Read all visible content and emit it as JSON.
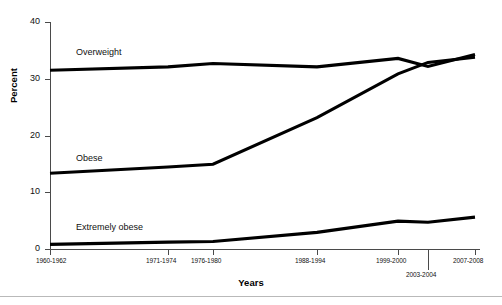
{
  "chart_data": {
    "type": "line",
    "title": "",
    "subtitle": "",
    "xlabel": "Years",
    "ylabel": "Percent",
    "categories": [
      "1960-1962",
      "1971-1974",
      "1976-1980",
      "1988-1994",
      "1999-2000",
      "2003-2004",
      "2007-2008"
    ],
    "ylim": [
      0,
      40
    ],
    "yticks": [
      0,
      10,
      20,
      30,
      40
    ],
    "ytick_labels": [
      "0",
      "10",
      "20",
      "30",
      "40"
    ],
    "grid": false,
    "legend_position": "inline-labels",
    "series": [
      {
        "name": "Overweight",
        "values": [
          31.5,
          32.1,
          32.7,
          32.1,
          33.6,
          32.2,
          34.3
        ],
        "color": "#000000"
      },
      {
        "name": "Obese",
        "values": [
          13.4,
          14.5,
          15.0,
          23.2,
          30.9,
          32.9,
          33.8
        ],
        "color": "#000000"
      },
      {
        "name": "Extremely obese",
        "values": [
          0.9,
          1.3,
          1.4,
          3.0,
          5.0,
          4.8,
          5.7
        ],
        "color": "#000000"
      }
    ],
    "annotations": [
      {
        "text": "Overweight",
        "x_category": "1960-1962",
        "note": "inline series label above line"
      },
      {
        "text": "Obese",
        "x_category": "1960-1962",
        "note": "inline series label above line"
      },
      {
        "text": "Extremely obese",
        "x_category": "1960-1962",
        "note": "inline series label above line"
      }
    ]
  },
  "axes": {
    "y_title": "Percent",
    "x_title": "Years",
    "y_ticks": [
      {
        "label": "40",
        "value": 40
      },
      {
        "label": "30",
        "value": 30
      },
      {
        "label": "20",
        "value": 20
      },
      {
        "label": "10",
        "value": 10
      },
      {
        "label": "0",
        "value": 0
      }
    ],
    "x_ticks": [
      {
        "label": "1960-1962",
        "row": 1
      },
      {
        "label": "1971-1974",
        "row": 1
      },
      {
        "label": "1976-1980",
        "row": 1
      },
      {
        "label": "1988-1994",
        "row": 1
      },
      {
        "label": "1999-2000",
        "row": 1
      },
      {
        "label": "2003-2004",
        "row": 2
      },
      {
        "label": "2007-2008",
        "row": 1
      }
    ]
  },
  "series_labels": {
    "overweight": "Overweight",
    "obese": "Obese",
    "extremely_obese": "Extremely obese"
  },
  "colors": {
    "line": "#000000",
    "axis": "#4a4a4a",
    "text": "#111111",
    "rule": "#b9b9b9",
    "background": "#ffffff"
  }
}
